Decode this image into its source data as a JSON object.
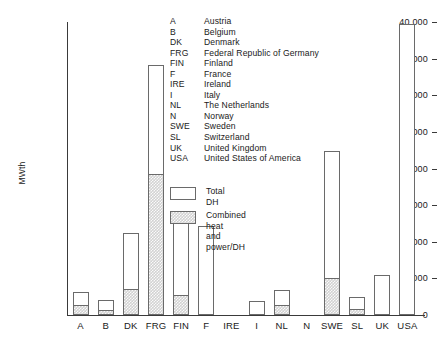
{
  "chart_data": {
    "type": "bar",
    "title": "",
    "xlabel": "",
    "ylabel": "MWth",
    "ylim": [
      0,
      40000
    ],
    "ytick_labels": [
      "40 000",
      "35 000",
      "30 000",
      "25 000",
      "20 000",
      "15 000",
      "10 000",
      "5 000",
      "0"
    ],
    "ytick_values": [
      40000,
      35000,
      30000,
      25000,
      20000,
      15000,
      10000,
      5000,
      0
    ],
    "grid": false,
    "legend_position": "upper-center",
    "categories": [
      "A",
      "B",
      "DK",
      "FRG",
      "FIN",
      "F",
      "IRE",
      "I",
      "NL",
      "N",
      "SWE",
      "SL",
      "UK",
      "USA"
    ],
    "series": [
      {
        "name": "Total DH",
        "values": [
          3200,
          2000,
          11200,
          34200,
          13100,
          12100,
          0,
          1900,
          3400,
          0,
          22400,
          2500,
          5400,
          39700
        ]
      },
      {
        "name": "Combined heat and power/DH",
        "values": [
          1400,
          700,
          3500,
          19200,
          2700,
          0,
          0,
          0,
          1400,
          0,
          5100,
          800,
          0,
          0
        ]
      }
    ]
  },
  "axis": {
    "y_label": "MWth"
  },
  "abbreviation_key": [
    {
      "abbr": "A",
      "name": "Austria"
    },
    {
      "abbr": "B",
      "name": "Belgium"
    },
    {
      "abbr": "DK",
      "name": "Denmark"
    },
    {
      "abbr": "FRG",
      "name": "Federal Republic of Germany"
    },
    {
      "abbr": "FIN",
      "name": "Finland"
    },
    {
      "abbr": "F",
      "name": "France"
    },
    {
      "abbr": "IRE",
      "name": "Ireland"
    },
    {
      "abbr": "I",
      "name": "Italy"
    },
    {
      "abbr": "NL",
      "name": "The Netherlands"
    },
    {
      "abbr": "N",
      "name": "Norway"
    },
    {
      "abbr": "SWE",
      "name": "Sweden"
    },
    {
      "abbr": "SL",
      "name": "Switzerland"
    },
    {
      "abbr": "UK",
      "name": "United Kingdom"
    },
    {
      "abbr": "USA",
      "name": "United States of America"
    }
  ],
  "series_legend": [
    {
      "label": "Total DH",
      "style": "solid"
    },
    {
      "label": "Combined heat\nand power/DH",
      "style": "hatch"
    }
  ],
  "colors": {
    "axis": "#3a3a3a",
    "bar_outline": "#6a6a6a",
    "bar_total_fill": "#ffffff",
    "bar_chp_fill": "#d2d2d2",
    "text": "#1a1a1a"
  }
}
